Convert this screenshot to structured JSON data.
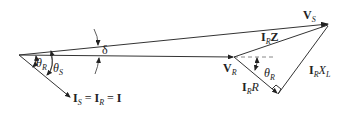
{
  "diagram": {
    "title": "",
    "type": "phasor-diagram",
    "colors": {
      "line": "#333333",
      "dashed": "#888888",
      "background": "#ffffff"
    },
    "labels": {
      "vs_main": "V",
      "vs_sub": "S",
      "vr_main": "V",
      "vr_sub": "R",
      "izz_main": "I",
      "izz_sub": "R",
      "izz_tail": "Z",
      "irr_main": "I",
      "irr_sub": "R",
      "irr_tail": "R",
      "irx_main": "I",
      "irx_sub": "R",
      "irx_tail": "X",
      "irx_tail_sub": "L",
      "delta": "δ",
      "theta_r_main": "θ",
      "theta_r_sub": "R",
      "theta_s_main": "θ",
      "theta_s_sub": "S",
      "theta_r2_main": "θ",
      "theta_r2_sub": "R",
      "current_is": "I",
      "current_is_sub": "S",
      "current_eq1": " = ",
      "current_ir": "I",
      "current_ir_sub": "R",
      "current_eq2": " = ",
      "current_i": "I"
    }
  }
}
